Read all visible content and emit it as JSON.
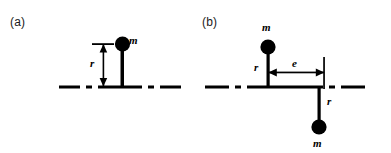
{
  "figure": {
    "background_color": "#ffffff",
    "ink_color": "#000000",
    "panels": [
      {
        "id": "a",
        "label": "(a)",
        "description": "single unbalanced mass on shaft",
        "masses": [
          {
            "label": "m",
            "position": "above-axis"
          }
        ],
        "dimensions": [
          {
            "label": "r",
            "orientation": "vertical",
            "description": "radius from axis to upper mass"
          }
        ],
        "axis": {
          "style": "dash-dot centerline"
        }
      },
      {
        "id": "b",
        "label": "(b)",
        "description": "two masses in couple separated axially",
        "masses": [
          {
            "label": "m",
            "position": "above-axis"
          },
          {
            "label": "m",
            "position": "below-axis"
          }
        ],
        "dimensions": [
          {
            "label": "r",
            "orientation": "vertical",
            "description": "radius from axis to upper mass"
          },
          {
            "label": "r",
            "orientation": "vertical",
            "description": "radius from axis to lower mass"
          },
          {
            "label": "e",
            "orientation": "horizontal",
            "description": "axial separation between the two masses"
          }
        ],
        "axis": {
          "style": "dash-dot centerline"
        }
      }
    ]
  }
}
